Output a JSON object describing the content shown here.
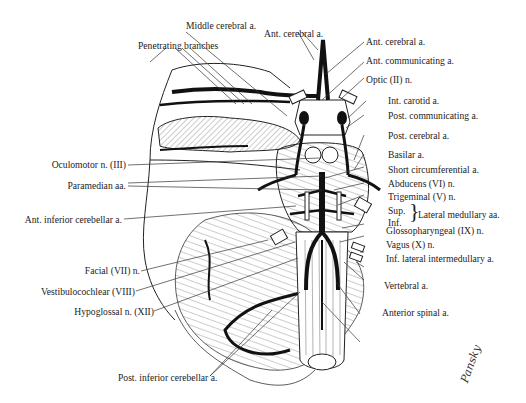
{
  "figure": {
    "signature": "Pansky"
  },
  "labels_top": {
    "middle_cerebral": "Middle cerebral a.",
    "penetrating_branches": "Penetrating branches",
    "ant_cerebral_top": "Ant. cerebral a."
  },
  "labels_right": [
    "Ant. cerebral a.",
    "Ant. communicating a.",
    "Optic (II) n.",
    "Int. carotid a.",
    "Post. communicating a.",
    "Post. cerebral a.",
    "Basilar a.",
    "Short circumferential a.",
    "Abducens (VI) n.",
    "Trigeminal (V) n.",
    "Sup.",
    "Inf.",
    "Lateral medullary aa.",
    "Glossopharyngeal (IX) n.",
    "Vagus (X) n.",
    "Inf. lateral intermedullary a.",
    "Vertebral a.",
    "Anterior spinal a."
  ],
  "labels_left": [
    "Oculomotor n. (III)",
    "Paramedian aa.",
    "Ant. inferior cerebellar a.",
    "Facial (VII) n.",
    "Vestibulocochlear (VIII)",
    "Hypoglossal n. (XII)"
  ],
  "labels_bottom": {
    "post_inferior_cerebellar": "Post. inferior cerebellar a."
  },
  "colors": {
    "ink": "#1a1a1a",
    "background": "#ffffff",
    "hatch": "#bdbdbd"
  }
}
